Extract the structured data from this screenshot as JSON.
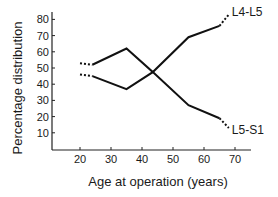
{
  "chart_data": {
    "type": "line",
    "title": "",
    "xlabel": "Age at operation (years)",
    "ylabel": "Percentage distribution",
    "xticks": [
      20,
      30,
      40,
      50,
      60,
      70
    ],
    "yticks": [
      10,
      20,
      30,
      40,
      50,
      60,
      70,
      80
    ],
    "xlim": [
      11,
      74
    ],
    "ylim": [
      0,
      86
    ],
    "grid": false,
    "legend": "inline labels at line ends",
    "series": [
      {
        "name": "L4-L5",
        "solid": {
          "x": [
            24,
            35,
            43.5,
            55,
            65
          ],
          "y": [
            52,
            62,
            47.5,
            69,
            76
          ]
        },
        "dashed_start": {
          "x": [
            20,
            24
          ],
          "y": [
            53,
            52
          ]
        },
        "dashed_end": {
          "x": [
            65,
            68
          ],
          "y": [
            76,
            83
          ]
        }
      },
      {
        "name": "L5-S1",
        "solid": {
          "x": [
            24,
            35,
            43.5,
            55,
            65
          ],
          "y": [
            45,
            37,
            47.5,
            27,
            19
          ]
        },
        "dashed_start": {
          "x": [
            20,
            24
          ],
          "y": [
            46,
            45
          ]
        },
        "dashed_end": {
          "x": [
            65,
            68
          ],
          "y": [
            19,
            13
          ]
        }
      }
    ]
  }
}
